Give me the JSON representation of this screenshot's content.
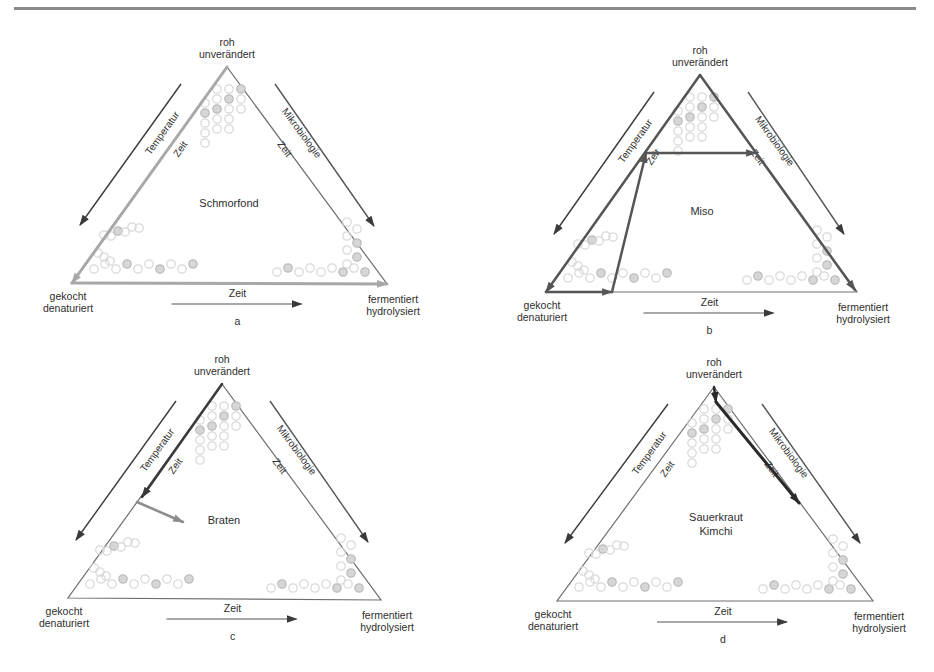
{
  "figure": {
    "vertex_labels": {
      "top": [
        "roh",
        "unverändert"
      ],
      "bottom_left": [
        "gekocht",
        "denaturiert"
      ],
      "bottom_right": [
        "fermentiert",
        "hydrolysiert"
      ]
    },
    "axis_labels": {
      "left_outer": "Temperatur",
      "left_inner": "Zeit",
      "right_outer": "Mikrobiologie",
      "right_inner": "Zeit",
      "bottom": "Zeit"
    },
    "colors": {
      "triangle_edge": "#6e6e6e",
      "dark_arrow": "#3a3a3a",
      "grey_arrow": "#8c8c8c",
      "light_grey_path": "#a8a8a8",
      "circle_stroke": "#cfcfcf",
      "circle_fill_accent": "#c8c8c8"
    },
    "panels": [
      {
        "id": "a",
        "letter": "a",
        "center_label": [
          "Schmorfond"
        ],
        "apex": [
          227,
          67
        ],
        "bl": [
          72,
          283
        ],
        "br": [
          387,
          284
        ],
        "paths": [
          {
            "points": [
              [
                227,
                67
              ],
              [
                72,
                283
              ]
            ],
            "color": "#a8a8a8",
            "width": 3,
            "arrow": true
          },
          {
            "points": [
              [
                72,
                283
              ],
              [
                387,
                284
              ]
            ],
            "color": "#a8a8a8",
            "width": 3,
            "arrow": true
          }
        ]
      },
      {
        "id": "b",
        "letter": "b",
        "center_label": [
          "Miso"
        ],
        "apex": [
          700,
          75
        ],
        "bl": [
          546,
          292
        ],
        "br": [
          857,
          292
        ],
        "paths": [
          {
            "points": [
              [
                700,
                75
              ],
              [
                546,
                292
              ]
            ],
            "color": "#555555",
            "width": 2.5,
            "arrow": true
          },
          {
            "points": [
              [
                546,
                292
              ],
              [
                612,
                292
              ]
            ],
            "color": "#555555",
            "width": 2.5,
            "arrow": true
          },
          {
            "points": [
              [
                612,
                292
              ],
              [
                646,
                153
              ]
            ],
            "color": "#555555",
            "width": 2.5,
            "arrow": true
          },
          {
            "points": [
              [
                646,
                153
              ],
              [
                756,
                153
              ]
            ],
            "color": "#555555",
            "width": 2.5,
            "arrow": true
          },
          {
            "points": [
              [
                700,
                75
              ],
              [
                855,
                290
              ]
            ],
            "color": "#555555",
            "width": 2.5,
            "arrow": true
          }
        ]
      },
      {
        "id": "c",
        "letter": "c",
        "center_label": [
          "Braten"
        ],
        "apex": [
          222,
          384
        ],
        "bl": [
          68,
          598
        ],
        "br": [
          381,
          600
        ],
        "paths": [
          {
            "points": [
              [
                222,
                384
              ],
              [
                142,
                497
              ]
            ],
            "color": "#3a3a3a",
            "width": 2.5,
            "arrow": true
          },
          {
            "points": [
              [
                137,
                502
              ],
              [
                183,
                522
              ]
            ],
            "color": "#8c8c8c",
            "width": 2.5,
            "arrow": true
          }
        ]
      },
      {
        "id": "d",
        "letter": "d",
        "center_label": [
          "Sauerkraut",
          "Kimchi"
        ],
        "apex": [
          714,
          387
        ],
        "bl": [
          557,
          601
        ],
        "br": [
          873,
          601
        ],
        "paths": [
          {
            "points": [
              [
                714,
                387
              ],
              [
                716,
                402
              ]
            ],
            "color": "#2a2a2a",
            "width": 2.5,
            "arrow": true
          },
          {
            "points": [
              [
                716,
                402
              ],
              [
                799,
                503
              ]
            ],
            "color": "#2a2a2a",
            "width": 3,
            "arrow": true
          }
        ]
      }
    ]
  }
}
